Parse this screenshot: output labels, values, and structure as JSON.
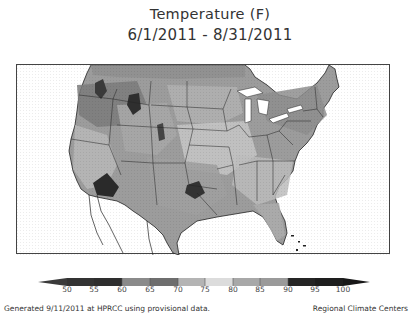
{
  "title": {
    "line1": "Temperature (F)",
    "line2": "6/1/2011 - 8/31/2011"
  },
  "map": {
    "region": "Contiguous United States",
    "variable": "Mean temperature (F)",
    "shading": "grayscale"
  },
  "colorbar": {
    "ticks": [
      "50",
      "55",
      "60",
      "65",
      "70",
      "75",
      "80",
      "85",
      "90",
      "95",
      "100"
    ],
    "bins": [
      {
        "range": "<50",
        "color": "#3a3a3a"
      },
      {
        "range": "50-55",
        "color": "#333333"
      },
      {
        "range": "55-60",
        "color": "#2e2e2e"
      },
      {
        "range": "60-65",
        "color": "#8a8a8a"
      },
      {
        "range": "65-70",
        "color": "#6e6e6e"
      },
      {
        "range": "70-75",
        "color": "#b4b4b4"
      },
      {
        "range": "75-80",
        "color": "#dcdcdc"
      },
      {
        "range": "80-85",
        "color": "#a8a8a8"
      },
      {
        "range": "85-90",
        "color": "#9a9a9a"
      },
      {
        "range": "90-95",
        "color": "#252525"
      },
      {
        "range": "95-100",
        "color": "#1e1e1e"
      },
      {
        "range": ">100",
        "color": "#181818"
      }
    ]
  },
  "footer": {
    "left": "Generated 9/11/2011 at HPRCC using provisional data.",
    "right": "Regional Climate Centers"
  }
}
